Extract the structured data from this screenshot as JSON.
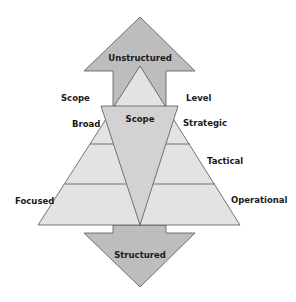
{
  "diagram": {
    "colors": {
      "arrow_fill": "#bdbdbd",
      "pyramid_fill": "#e3e3e3",
      "scope_fill": "#d2d2d2",
      "stroke": "#555555",
      "text": "#1a1a1a"
    },
    "up_arrow": {
      "label": "Unstructured"
    },
    "down_arrow": {
      "label": "Structured"
    },
    "center": {
      "label": "Scope"
    },
    "left_axis": {
      "title": "Scope",
      "top_label": "Broad",
      "bottom_label": "Focused"
    },
    "right_axis": {
      "title": "Level",
      "levels": [
        "Strategic",
        "Tactical",
        "Operational"
      ]
    }
  }
}
